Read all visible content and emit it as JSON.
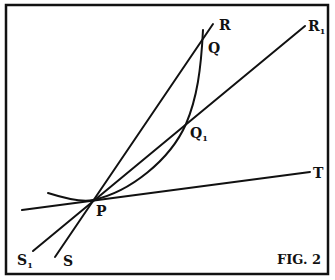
{
  "figure": {
    "caption": "FIG. 2",
    "ink_color": "#111111",
    "background": "#ffffff"
  },
  "labels": {
    "R": "R",
    "R1": "R",
    "R1_sub": "1",
    "Q": "Q",
    "Q1": "Q",
    "Q1_sub": "1",
    "T": "T",
    "P": "P",
    "S": "S",
    "S1": "S",
    "S1_sub": "1"
  },
  "lines": [
    {
      "name": "secant-SR",
      "from": "S",
      "to": "R",
      "through": [
        "P",
        "Q"
      ]
    },
    {
      "name": "secant-S1R1",
      "from": "S1",
      "to": "R1",
      "through": [
        "P",
        "Q1"
      ]
    },
    {
      "name": "tangent-PT",
      "through": [
        "P"
      ],
      "to": "T"
    }
  ],
  "curve": {
    "name": "curve",
    "through": [
      "P",
      "Q1",
      "Q"
    ]
  }
}
